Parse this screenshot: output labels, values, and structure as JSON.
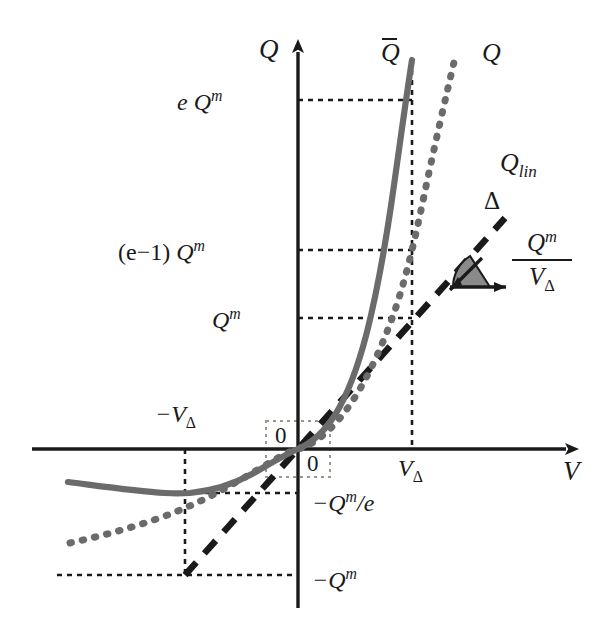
{
  "figure": {
    "title": "",
    "axes": {
      "x_label": "V",
      "y_label": "Q",
      "origin_label_upper": "0",
      "origin_label_lower": "0"
    },
    "curves": [
      {
        "name": "Q-bar",
        "label": "Q",
        "label_overbar": true,
        "style": "solid",
        "color": "#6b6b6b"
      },
      {
        "name": "Q",
        "label": "Q",
        "style": "dotted",
        "color": "#6b6b6b"
      },
      {
        "name": "Q-lin",
        "label_base": "Q",
        "label_sub": "lin",
        "style": "dashed",
        "color": "#1a1a1a"
      }
    ],
    "y_ticks": [
      {
        "id": "e-qm",
        "base": "e Q",
        "sup": "m",
        "value_px": 100
      },
      {
        "id": "e-minus-1-qm",
        "prefix": "(e−1) ",
        "base": "Q",
        "sup": "m",
        "value_px": 250
      },
      {
        "id": "qm",
        "base": "Q",
        "sup": "m",
        "value_px": 318
      },
      {
        "id": "neg-qm-over-e",
        "base": "−Q",
        "sup": "m",
        "suffix": "/e",
        "value_px": 500
      },
      {
        "id": "neg-qm",
        "base": "−Q",
        "sup": "m",
        "value_px": 578
      }
    ],
    "x_ticks": [
      {
        "id": "neg-v-delta",
        "base": "−V",
        "sub": "Δ",
        "value_px": 185
      },
      {
        "id": "v-delta",
        "base": "V",
        "sub": "Δ",
        "value_px": 412
      }
    ],
    "slope_annotation": {
      "delta_symbol": "Δ",
      "numerator": "Q",
      "numerator_sup": "m",
      "denominator": "V",
      "denominator_sub": "Δ",
      "wedge_color": "#8a8a8a"
    },
    "colors": {
      "axis": "#1a1a1a",
      "curve_gray": "#6b6b6b",
      "dashed_black": "#1a1a1a",
      "guide_dotted": "#1a1a1a",
      "background": "#ffffff"
    }
  }
}
